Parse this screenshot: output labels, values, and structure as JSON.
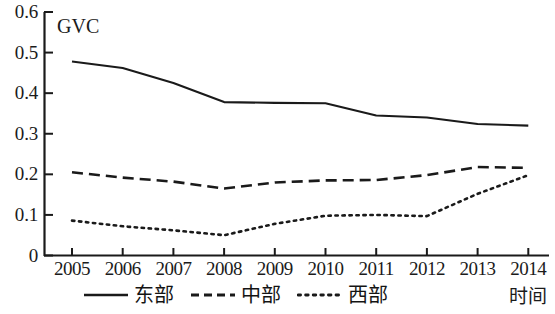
{
  "chart_data": {
    "type": "line",
    "title": "",
    "ylabel": "GVC",
    "xlabel": "时间",
    "x": [
      2005,
      2006,
      2007,
      2008,
      2009,
      2010,
      2011,
      2012,
      2013,
      2014
    ],
    "categories": [
      "2005",
      "2006",
      "2007",
      "2008",
      "2009",
      "2010",
      "2011",
      "2012",
      "2013",
      "2014"
    ],
    "ylim": [
      0,
      0.6
    ],
    "yticks": [
      0,
      0.1,
      0.2,
      0.3,
      0.4,
      0.5,
      0.6
    ],
    "ytick_labels": [
      "0",
      "0.1",
      "0.2",
      "0.3",
      "0.4",
      "0.5",
      "0.6"
    ],
    "grid": false,
    "legend_position": "bottom",
    "series": [
      {
        "name": "东部",
        "style": "solid",
        "color": "#1a1a1a",
        "values": [
          0.478,
          0.462,
          0.425,
          0.378,
          0.376,
          0.375,
          0.345,
          0.34,
          0.324,
          0.32
        ]
      },
      {
        "name": "中部",
        "style": "dashed",
        "color": "#1a1a1a",
        "values": [
          0.205,
          0.192,
          0.182,
          0.165,
          0.18,
          0.185,
          0.186,
          0.198,
          0.218,
          0.216
        ]
      },
      {
        "name": "西部",
        "style": "dotted",
        "color": "#1a1a1a",
        "values": [
          0.086,
          0.072,
          0.062,
          0.05,
          0.078,
          0.098,
          0.1,
          0.097,
          0.152,
          0.198
        ]
      }
    ]
  },
  "axis": {
    "y_label_text": "GVC",
    "x_label_text": "时间",
    "y_ticks": [
      "0.6",
      "0.5",
      "0.4",
      "0.3",
      "0.2",
      "0.1",
      "0"
    ],
    "x_ticks": [
      "2005",
      "2006",
      "2007",
      "2008",
      "2009",
      "2010",
      "2011",
      "2012",
      "2013",
      "2014"
    ]
  },
  "legend": {
    "items": [
      {
        "label": "东部",
        "style": "solid"
      },
      {
        "label": "中部",
        "style": "dashed"
      },
      {
        "label": "西部",
        "style": "dotted"
      }
    ]
  },
  "colors": {
    "ink": "#1a1a1a",
    "background": "#ffffff"
  }
}
